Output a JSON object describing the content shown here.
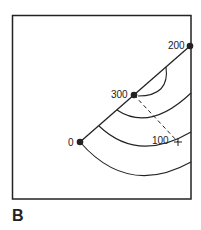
{
  "figure": {
    "panel_label": "B",
    "points": [
      {
        "label": "0",
        "x": 80,
        "y": 142
      },
      {
        "label": "300",
        "x": 134,
        "y": 95
      },
      {
        "label": "200",
        "x": 190,
        "y": 46
      }
    ],
    "marker": {
      "label": "100",
      "x": 178,
      "y": 142,
      "symbol": "+"
    },
    "colors": {
      "stroke": "#222222",
      "background": "#ffffff"
    }
  }
}
